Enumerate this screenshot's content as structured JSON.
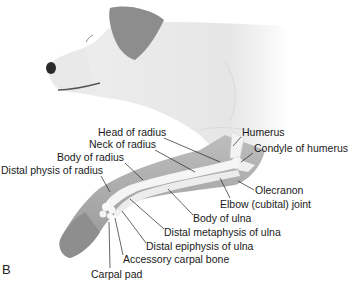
{
  "figure": {
    "panel_letter": "B",
    "labels": [
      {
        "id": "head-of-radius",
        "text": "Head of radius",
        "x": 98,
        "y": 131
      },
      {
        "id": "humerus",
        "text": "Humerus",
        "x": 242,
        "y": 131
      },
      {
        "id": "neck-of-radius",
        "text": "Neck of radius",
        "x": 89,
        "y": 143
      },
      {
        "id": "condyle-of-humerus",
        "text": "Condyle of humerus",
        "x": 254,
        "y": 147
      },
      {
        "id": "body-of-radius",
        "text": "Body of radius",
        "x": 57,
        "y": 156
      },
      {
        "id": "distal-physis-of-radius",
        "text": "Distal physis of radius",
        "x": 1,
        "y": 169
      },
      {
        "id": "olecranon",
        "text": "Olecranon",
        "x": 255,
        "y": 184
      },
      {
        "id": "elbow-joint",
        "text": "Elbow (cubital) joint",
        "x": 220,
        "y": 198
      },
      {
        "id": "body-of-ulna",
        "text": "Body of ulna",
        "x": 193,
        "y": 212
      },
      {
        "id": "distal-metaphysis-of-ulna",
        "text": "Distal metaphysis of ulna",
        "x": 164,
        "y": 226
      },
      {
        "id": "distal-epiphysis-of-ulna",
        "text": "Distal epiphysis of ulna",
        "x": 146,
        "y": 240
      },
      {
        "id": "accessory-carpal-bone",
        "text": "Accessory carpal bone",
        "x": 123,
        "y": 255
      },
      {
        "id": "carpal-pad",
        "text": "Carpal pad",
        "x": 91,
        "y": 270
      }
    ]
  },
  "colors": {
    "background": "#ffffff",
    "fur": "#ededed",
    "ear": "#8a8a8a",
    "limb": "#a9a9a9",
    "bone": "#f4f4f4",
    "leader": "#222222"
  }
}
